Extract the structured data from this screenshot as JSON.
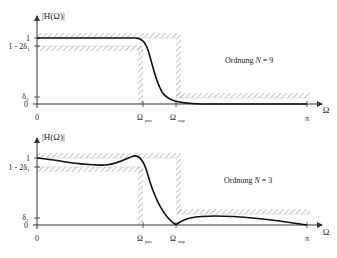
{
  "colors": {
    "axis": "#555555",
    "curve": "#111111",
    "hatch": "#8a8a8a",
    "guide": "#cfcfcf",
    "background": "#ffffff"
  },
  "top_plot": {
    "y_axis_label": "|H(Ω)|",
    "y_ticks": {
      "one": "1",
      "one_minus": "1 - 2δ",
      "one_minus_sub": "1",
      "delta": "δ",
      "delta_sub": "2",
      "zero": "0"
    },
    "x_ticks": {
      "zero": "0",
      "pass": "Ω",
      "pass_sub": "pass",
      "stop": "Ω",
      "stop_sub": "stop",
      "pi": "π"
    },
    "x_axis_label": "Ω",
    "annotation": "Ordnung N = 9",
    "annotation_prefix": "Ordnung ",
    "annotation_var": "N",
    "annotation_suffix": " = 9"
  },
  "bottom_plot": {
    "y_axis_label": "|H(Ω)|",
    "y_ticks": {
      "one": "1",
      "one_minus": "1 - 2δ",
      "one_minus_sub": "1",
      "delta": "δ",
      "delta_sub": "2",
      "zero": "0"
    },
    "x_ticks": {
      "zero": "0",
      "pass": "Ω",
      "pass_sub": "pass",
      "stop": "Ω",
      "stop_sub": "stop",
      "pi": "π"
    },
    "x_axis_label": "Ω",
    "annotation": "Ordnung N = 3",
    "annotation_prefix": "Ordnung ",
    "annotation_var": "N",
    "annotation_suffix": " = 3"
  }
}
